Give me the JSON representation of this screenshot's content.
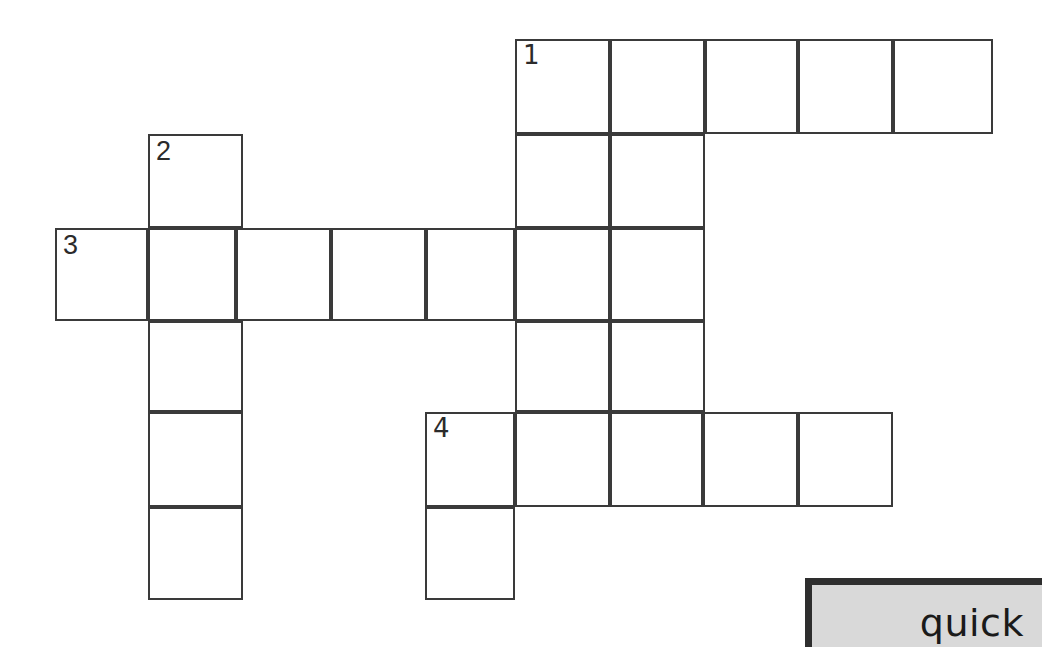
{
  "puzzle": {
    "title": "Crossword Grid",
    "cell_size": 95,
    "grid_color": "#3a3a3a",
    "cell_fill": "#ffffff",
    "background": "#ffffff",
    "clue_numbers": {
      "one": "1",
      "two": "2",
      "three": "3",
      "four": "4"
    },
    "entries": [
      {
        "number": "1",
        "direction": "across",
        "length": 5,
        "start_x": 515,
        "start_y": 39
      },
      {
        "number": "1",
        "direction": "down",
        "length": 6,
        "start_x": 515,
        "start_y": 39
      },
      {
        "number": "2",
        "direction": "down",
        "length": 5,
        "start_x": 148,
        "start_y": 134
      },
      {
        "number": "3",
        "direction": "across",
        "length": 7,
        "start_x": 55,
        "start_y": 228
      },
      {
        "number": "4",
        "direction": "across",
        "length": 5,
        "start_x": 425,
        "start_y": 412
      },
      {
        "number": "4",
        "direction": "down",
        "length": 2,
        "start_x": 425,
        "start_y": 412
      }
    ],
    "cells": [
      {
        "id": "c-r0-x515",
        "x": 515,
        "y": 39,
        "w": 95,
        "h": 95,
        "num": "1",
        "num_style": "bar1"
      },
      {
        "id": "c-r0-x610",
        "x": 610,
        "y": 39,
        "w": 95,
        "h": 95,
        "num": ""
      },
      {
        "id": "c-r0-x705",
        "x": 705,
        "y": 39,
        "w": 93,
        "h": 95,
        "num": ""
      },
      {
        "id": "c-r0-x798",
        "x": 798,
        "y": 39,
        "w": 95,
        "h": 95,
        "num": ""
      },
      {
        "id": "c-r0-x893",
        "x": 893,
        "y": 39,
        "w": 100,
        "h": 95,
        "num": ""
      },
      {
        "id": "c-r1-x148",
        "x": 148,
        "y": 134,
        "w": 95,
        "h": 94,
        "num": "2",
        "num_style": "plain"
      },
      {
        "id": "c-r1-x515",
        "x": 515,
        "y": 134,
        "w": 95,
        "h": 94,
        "num": ""
      },
      {
        "id": "c-r1-x610",
        "x": 610,
        "y": 134,
        "w": 95,
        "h": 94,
        "num": ""
      },
      {
        "id": "c-r2-x55",
        "x": 55,
        "y": 228,
        "w": 93,
        "h": 93,
        "num": "3",
        "num_style": "plain"
      },
      {
        "id": "c-r2-x148",
        "x": 148,
        "y": 228,
        "w": 88,
        "h": 93,
        "num": ""
      },
      {
        "id": "c-r2-x236",
        "x": 236,
        "y": 228,
        "w": 95,
        "h": 93,
        "num": ""
      },
      {
        "id": "c-r2-x331",
        "x": 331,
        "y": 228,
        "w": 95,
        "h": 93,
        "num": ""
      },
      {
        "id": "c-r2-x426",
        "x": 426,
        "y": 228,
        "w": 89,
        "h": 93,
        "num": ""
      },
      {
        "id": "c-r2-x515",
        "x": 515,
        "y": 228,
        "w": 95,
        "h": 93,
        "num": ""
      },
      {
        "id": "c-r2-x610",
        "x": 610,
        "y": 228,
        "w": 95,
        "h": 93,
        "num": ""
      },
      {
        "id": "c-r3-x148",
        "x": 148,
        "y": 321,
        "w": 95,
        "h": 91,
        "num": ""
      },
      {
        "id": "c-r3-x515",
        "x": 515,
        "y": 321,
        "w": 95,
        "h": 91,
        "num": ""
      },
      {
        "id": "c-r3-x610",
        "x": 610,
        "y": 321,
        "w": 95,
        "h": 91,
        "num": ""
      },
      {
        "id": "c-r4-x148",
        "x": 148,
        "y": 412,
        "w": 95,
        "h": 95,
        "num": ""
      },
      {
        "id": "c-r4-x425",
        "x": 425,
        "y": 412,
        "w": 90,
        "h": 95,
        "num": "4",
        "num_style": "open4"
      },
      {
        "id": "c-r4-x515",
        "x": 515,
        "y": 412,
        "w": 95,
        "h": 95,
        "num": ""
      },
      {
        "id": "c-r4-x610",
        "x": 610,
        "y": 412,
        "w": 93,
        "h": 95,
        "num": ""
      },
      {
        "id": "c-r4-x703",
        "x": 703,
        "y": 412,
        "w": 95,
        "h": 95,
        "num": ""
      },
      {
        "id": "c-r4-x798",
        "x": 798,
        "y": 412,
        "w": 95,
        "h": 95,
        "num": ""
      },
      {
        "id": "c-r5-x148",
        "x": 148,
        "y": 507,
        "w": 95,
        "h": 93,
        "num": ""
      },
      {
        "id": "c-r5-x425",
        "x": 425,
        "y": 507,
        "w": 90,
        "h": 93,
        "num": ""
      }
    ]
  },
  "hint_panel": {
    "word": "quick",
    "x": 805,
    "y": 578,
    "width": 237,
    "height": 69,
    "background": "#d9d9d9",
    "border_color": "#2e2e2e"
  }
}
